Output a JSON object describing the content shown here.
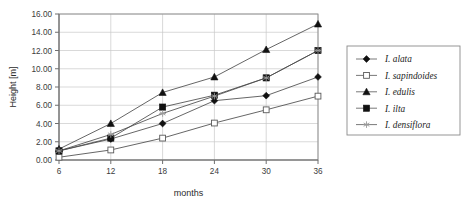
{
  "chart_data": {
    "type": "line",
    "title": "",
    "xlabel": "months",
    "ylabel": "Height [m]",
    "x": [
      6,
      12,
      18,
      24,
      30,
      36
    ],
    "xticklabels": [
      "6",
      "12",
      "18",
      "24",
      "30",
      "36"
    ],
    "yticklabels": [
      "0.00",
      "2.00",
      "4.00",
      "6.00",
      "8.00",
      "10.00",
      "12.00",
      "14.00",
      "16.00"
    ],
    "yticks": [
      0,
      2,
      4,
      6,
      8,
      10,
      12,
      14,
      16
    ],
    "ylim": [
      0,
      16
    ],
    "xlim": [
      6,
      36
    ],
    "grid": true,
    "legend_position": "right",
    "series": [
      {
        "name": "I. alata",
        "marker": "filled-diamond",
        "values": [
          1.0,
          2.3,
          4.0,
          6.5,
          7.05,
          9.1
        ]
      },
      {
        "name": "I. sapindoides",
        "marker": "open-square",
        "values": [
          0.3,
          1.1,
          2.4,
          4.05,
          5.5,
          7.0
        ]
      },
      {
        "name": "I. edulis",
        "marker": "filled-triangle",
        "values": [
          1.2,
          4.0,
          7.4,
          9.1,
          12.1,
          14.9
        ]
      },
      {
        "name": "I. ilta",
        "marker": "filled-square",
        "values": [
          1.0,
          2.4,
          5.8,
          7.1,
          9.0,
          12.0
        ]
      },
      {
        "name": "I. densiflora",
        "marker": "star",
        "values": [
          1.0,
          2.8,
          5.1,
          7.0,
          9.0,
          12.0
        ]
      }
    ]
  },
  "axis": {
    "y_title": "Height [m]",
    "x_title": "months"
  }
}
